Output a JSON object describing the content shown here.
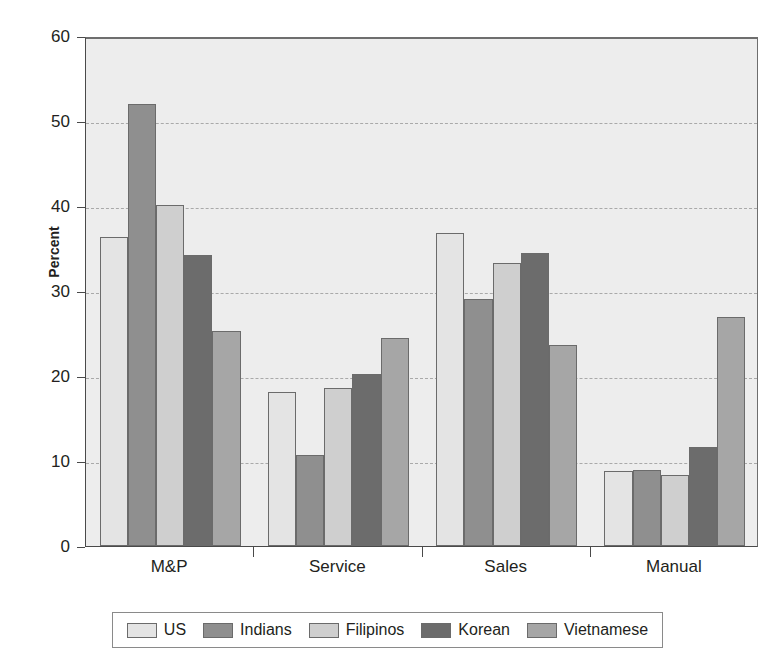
{
  "chart_data": {
    "type": "bar",
    "title": "",
    "xlabel": "",
    "ylabel": "Percent",
    "ylim": [
      0,
      60
    ],
    "yticks": [
      0,
      10,
      20,
      30,
      40,
      50,
      60
    ],
    "ytick_labels": [
      "0",
      "10",
      "20",
      "30",
      "40",
      "50",
      "60"
    ],
    "grid": "horizontal-dashed",
    "legend_position": "bottom",
    "categories": [
      "M&P",
      "Service",
      "Sales",
      "Manual"
    ],
    "series": [
      {
        "name": "US",
        "color": "#e4e4e4",
        "values": [
          36.3,
          18.1,
          36.8,
          8.8
        ]
      },
      {
        "name": "Indians",
        "color": "#8f8f8f",
        "values": [
          52.0,
          10.7,
          29.1,
          8.9
        ]
      },
      {
        "name": "Filipinos",
        "color": "#cfcfcf",
        "values": [
          40.1,
          18.6,
          33.3,
          8.3
        ]
      },
      {
        "name": "Korean",
        "color": "#6c6c6c",
        "values": [
          34.2,
          20.2,
          34.5,
          11.6
        ]
      },
      {
        "name": "Vietnamese",
        "color": "#a6a6a6",
        "values": [
          25.3,
          24.5,
          23.7,
          26.9
        ]
      }
    ],
    "plot_background": "#ededed",
    "gridline_color": "#a9a9a9",
    "axis_color": "#4a4a4a"
  }
}
